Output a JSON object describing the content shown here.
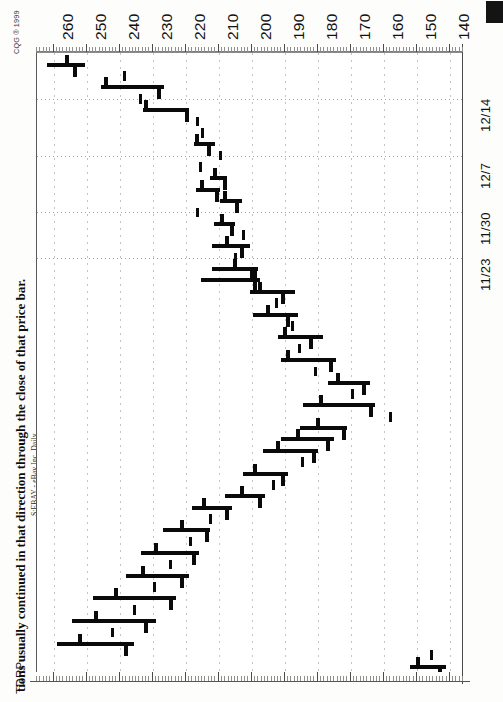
{
  "page": {
    "caption": "tions usually continued in that direction through the close of that price bar.",
    "copyright": "CQG ® 1999",
    "study_label": "TDRP"
  },
  "chart_meta": {
    "series_label": "S:EBAY - eBay Inc. Daily",
    "symbol": "S:EBAY",
    "company": "eBay Inc.",
    "interval": "Daily",
    "orientation": "rotated-90",
    "price_axis_position": "top",
    "date_axis_position": "right"
  },
  "chart_data": {
    "type": "bar",
    "title": "S:EBAY - eBay Inc. Daily",
    "xlabel": "",
    "ylabel": "",
    "grid": true,
    "legend": "none",
    "price_ticks": [
      260,
      250,
      240,
      230,
      220,
      210,
      200,
      190,
      180,
      170,
      160,
      150,
      140
    ],
    "price_axis_range": [
      265,
      136
    ],
    "price_axis_direction": "descending-left-to-right",
    "date_ticks": [
      "12/14",
      "12/7",
      "11/30",
      "11/23"
    ],
    "date_axis_direction": "newest-at-top",
    "ohlc_note": "Rotated OHLC bars: horizontal rule = high-low range, upper tick = open, lower tick = close.",
    "bars": [
      {
        "date": "12/17",
        "high": 262.0,
        "low": 250.5,
        "open": 256.0,
        "close": 253.5
      },
      {
        "date": "12/16",
        "high": 239.0,
        "low": 239.0,
        "open": 239.0,
        "close": 239.0
      },
      {
        "date": "12/15",
        "high": 245.5,
        "low": 226.5,
        "open": 244.0,
        "close": 228.0
      },
      {
        "date": "12/14",
        "high": 234.0,
        "low": 234.0,
        "open": 234.0,
        "close": 234.0
      },
      {
        "date": "12/13",
        "high": 233.0,
        "low": 219.0,
        "open": 232.0,
        "close": 219.5
      },
      {
        "date": "12/10",
        "high": 217.0,
        "low": 217.0,
        "open": 217.0,
        "close": 217.0
      },
      {
        "date": "12/9",
        "high": 215.5,
        "low": 215.5,
        "open": 215.5,
        "close": 215.5
      },
      {
        "date": "12/8",
        "high": 217.5,
        "low": 211.0,
        "open": 216.5,
        "close": 213.0
      },
      {
        "date": "12/7",
        "high": 210.0,
        "low": 210.0,
        "open": 210.0,
        "close": 210.0
      },
      {
        "date": "12/6",
        "high": 216.0,
        "low": 216.0,
        "open": 216.0,
        "close": 216.0
      },
      {
        "date": "12/3",
        "high": 212.5,
        "low": 207.5,
        "open": 211.0,
        "close": 208.0
      },
      {
        "date": "12/2",
        "high": 217.0,
        "low": 209.5,
        "open": 215.0,
        "close": 210.5
      },
      {
        "date": "12/1",
        "high": 209.5,
        "low": 203.0,
        "open": 208.0,
        "close": 204.5
      },
      {
        "date": "11/30",
        "high": 217.0,
        "low": 217.0,
        "open": 217.0,
        "close": 217.0
      },
      {
        "date": "11/29",
        "high": 211.5,
        "low": 205.0,
        "open": 209.0,
        "close": 206.0
      },
      {
        "date": "11/26",
        "high": 203.0,
        "low": 203.0,
        "open": 203.0,
        "close": 203.0
      },
      {
        "date": "11/24",
        "high": 212.0,
        "low": 200.5,
        "open": 207.5,
        "close": 203.0
      },
      {
        "date": "11/23",
        "high": 205.5,
        "low": 205.5,
        "open": 205.5,
        "close": 205.5
      },
      {
        "date": "11/22",
        "high": 212.0,
        "low": 198.0,
        "open": 205.0,
        "close": 199.0
      },
      {
        "date": "11/19",
        "high": 215.5,
        "low": 197.5,
        "open": 200.0,
        "close": 199.0
      },
      {
        "date": "11/18",
        "high": 200.5,
        "low": 187.0,
        "open": 197.5,
        "close": 190.5
      },
      {
        "date": "11/17",
        "high": 193.0,
        "low": 193.0,
        "open": 193.0,
        "close": 193.0
      },
      {
        "date": "11/16",
        "high": 199.5,
        "low": 186.0,
        "open": 195.0,
        "close": 189.0
      },
      {
        "date": "11/15",
        "high": 188.0,
        "low": 188.0,
        "open": 188.0,
        "close": 188.0
      },
      {
        "date": "11/12",
        "high": 192.0,
        "low": 178.5,
        "open": 190.0,
        "close": 182.0
      },
      {
        "date": "11/11",
        "high": 186.0,
        "low": 186.0,
        "open": 186.0,
        "close": 186.0
      },
      {
        "date": "11/10",
        "high": 191.0,
        "low": 174.5,
        "open": 189.0,
        "close": 176.0
      },
      {
        "date": "11/9",
        "high": 181.0,
        "low": 181.0,
        "open": 181.0,
        "close": 181.0
      },
      {
        "date": "11/8",
        "high": 177.0,
        "low": 164.0,
        "open": 174.0,
        "close": 166.0
      },
      {
        "date": "11/5",
        "high": 170.0,
        "low": 170.0,
        "open": 170.0,
        "close": 170.0
      },
      {
        "date": "11/4",
        "high": 184.5,
        "low": 162.5,
        "open": 179.0,
        "close": 164.0
      },
      {
        "date": "11/3",
        "high": 158.5,
        "low": 158.5,
        "open": 158.5,
        "close": 158.5
      },
      {
        "date": "11/2",
        "high": 185.5,
        "low": 171.0,
        "open": 180.0,
        "close": 172.0
      },
      {
        "date": "11/1",
        "high": 191.0,
        "low": 175.0,
        "open": 186.0,
        "close": 177.0
      },
      {
        "date": "10/29",
        "high": 196.5,
        "low": 180.0,
        "open": 192.0,
        "close": 181.0
      },
      {
        "date": "10/28",
        "high": 185.0,
        "low": 185.0,
        "open": 185.0,
        "close": 185.0
      },
      {
        "date": "10/27",
        "high": 202.5,
        "low": 189.0,
        "open": 199.0,
        "close": 190.5
      },
      {
        "date": "10/26",
        "high": 194.0,
        "low": 194.0,
        "open": 194.0,
        "close": 194.0
      },
      {
        "date": "10/25",
        "high": 208.0,
        "low": 196.0,
        "open": 203.0,
        "close": 197.5
      },
      {
        "date": "10/22",
        "high": 218.0,
        "low": 206.0,
        "open": 214.5,
        "close": 207.5
      },
      {
        "date": "10/21",
        "high": 213.0,
        "low": 213.0,
        "open": 213.0,
        "close": 213.0
      },
      {
        "date": "10/20",
        "high": 227.0,
        "low": 212.5,
        "open": 221.0,
        "close": 213.5
      },
      {
        "date": "10/19",
        "high": 219.0,
        "low": 219.0,
        "open": 219.0,
        "close": 219.0
      },
      {
        "date": "10/18",
        "high": 233.5,
        "low": 216.0,
        "open": 229.0,
        "close": 217.5
      },
      {
        "date": "10/15",
        "high": 225.0,
        "low": 225.0,
        "open": 225.0,
        "close": 225.0
      },
      {
        "date": "10/14",
        "high": 238.0,
        "low": 219.0,
        "open": 233.0,
        "close": 221.0
      },
      {
        "date": "10/13",
        "high": 230.0,
        "low": 230.0,
        "open": 230.0,
        "close": 230.0
      },
      {
        "date": "10/12",
        "high": 248.0,
        "low": 223.0,
        "open": 241.0,
        "close": 224.5
      },
      {
        "date": "10/11",
        "high": 236.0,
        "low": 236.0,
        "open": 236.0,
        "close": 236.0
      },
      {
        "date": "10/8",
        "high": 254.5,
        "low": 229.0,
        "open": 247.0,
        "close": 232.0
      },
      {
        "date": "10/7",
        "high": 242.5,
        "low": 242.5,
        "open": 242.5,
        "close": 242.5
      },
      {
        "date": "10/6",
        "high": 259.0,
        "low": 235.5,
        "open": 252.0,
        "close": 238.0
      },
      {
        "date": "10/5",
        "high": 146.0,
        "low": 146.0,
        "open": 146.0,
        "close": 146.0
      },
      {
        "date": "10/4",
        "high": 152.0,
        "low": 141.0,
        "open": 149.5,
        "close": 143.0
      }
    ]
  }
}
